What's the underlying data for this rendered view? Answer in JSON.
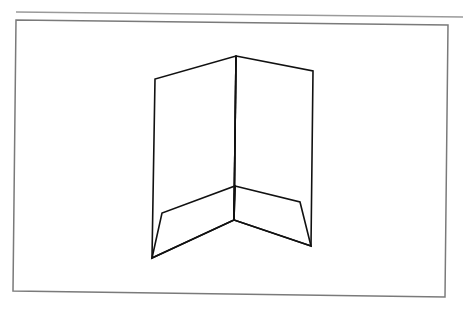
{
  "diagram": {
    "colors": {
      "background": "#ffffff",
      "frame": "#7a7a7a",
      "rule": "#9a9a9a",
      "drawing": "#111111"
    },
    "rule_line": {
      "x1": 16,
      "y1": 12,
      "x2": 463,
      "y2": 17
    },
    "frame": [
      [
        16,
        20
      ],
      [
        448,
        25
      ],
      [
        445,
        297
      ],
      [
        13,
        291
      ]
    ],
    "folder": {
      "left_panel": [
        [
          152,
          258
        ],
        [
          155,
          79
        ],
        [
          236,
          56
        ],
        [
          234,
          220
        ]
      ],
      "right_panel": [
        [
          236,
          56
        ],
        [
          313,
          71
        ],
        [
          311,
          246
        ],
        [
          234,
          220
        ]
      ],
      "spine": [
        [
          236,
          56
        ],
        [
          234,
          220
        ]
      ],
      "left_pocket": [
        [
          152,
          258
        ],
        [
          162,
          213
        ],
        [
          235,
          186
        ],
        [
          234,
          220
        ]
      ],
      "right_pocket": [
        [
          235,
          186
        ],
        [
          300,
          202
        ],
        [
          311,
          246
        ],
        [
          234,
          220
        ]
      ]
    }
  }
}
